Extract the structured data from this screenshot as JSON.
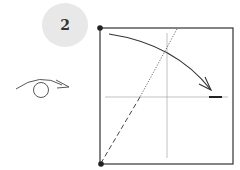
{
  "step": {
    "number": "2"
  },
  "diagram": {
    "colors": {
      "line": "#333333",
      "badge": "#e8e8e8"
    },
    "symbols": [
      "turn-over-symbol",
      "fold-arrow",
      "valley-fold-line",
      "crease-lines",
      "corner-dots"
    ]
  }
}
